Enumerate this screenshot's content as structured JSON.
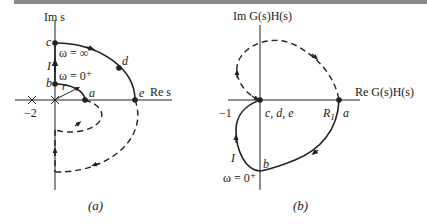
{
  "figure": {
    "panel_a": {
      "caption": "(a)",
      "axis_y_label": "Im s",
      "axis_x_label": "Re s",
      "tick_label": "−2",
      "points": {
        "a": "a",
        "b": "b",
        "c": "c",
        "d": "d",
        "e": "e"
      },
      "labels": {
        "I": "I",
        "r": "r",
        "omega_inf": "ω = ∞",
        "omega_0": "ω = 0⁺"
      }
    },
    "panel_b": {
      "caption": "(b)",
      "axis_y_label": "Im G(s)H(s)",
      "axis_x_label": "Re  G(s)H(s)",
      "tick_label": "−1",
      "points": {
        "a": "a",
        "b": "b",
        "cde": "c, d, e"
      },
      "labels": {
        "R1": "R",
        "R1_sub": "1",
        "I": "I",
        "omega_0": "ω = 0⁺"
      }
    },
    "colors": {
      "line": "#222222",
      "topbar": "#8a8a8a"
    }
  }
}
